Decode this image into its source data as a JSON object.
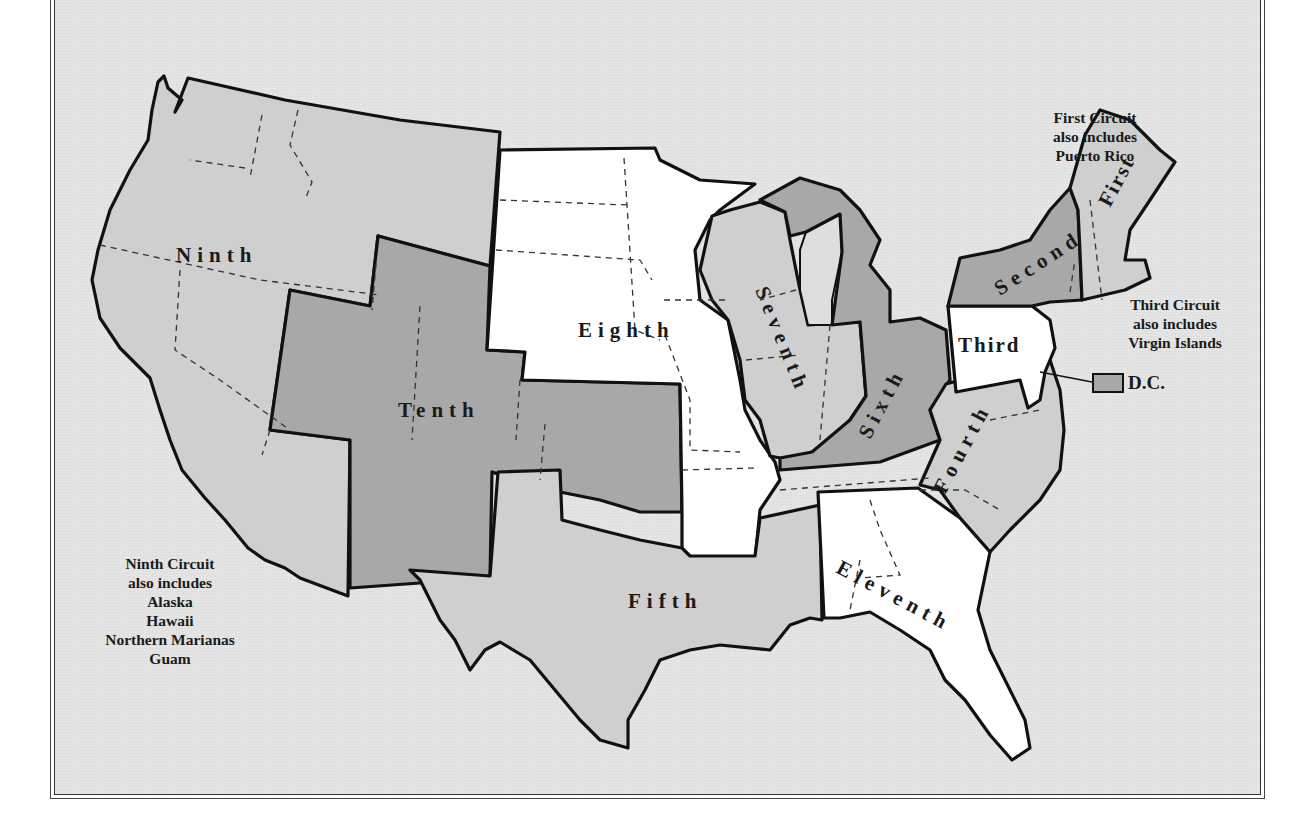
{
  "map": {
    "subject": "U.S. Federal Judicial Circuits",
    "colors": {
      "background": "#e4e4e4",
      "light_gray_fill": "#cfcfcf",
      "dark_gray_fill": "#a8a8a8",
      "white_fill": "#ffffff",
      "border": "#111111"
    },
    "circuits": [
      {
        "id": "first",
        "label": "First",
        "fill": "light"
      },
      {
        "id": "second",
        "label": "Second",
        "fill": "dark"
      },
      {
        "id": "third",
        "label": "Third",
        "fill": "white"
      },
      {
        "id": "fourth",
        "label": "Fourth",
        "fill": "light"
      },
      {
        "id": "fifth",
        "label": "Fifth",
        "fill": "light"
      },
      {
        "id": "sixth",
        "label": "Sixth",
        "fill": "dark"
      },
      {
        "id": "seventh",
        "label": "Seventh",
        "fill": "light"
      },
      {
        "id": "eighth",
        "label": "Eighth",
        "fill": "white"
      },
      {
        "id": "ninth",
        "label": "Ninth",
        "fill": "light"
      },
      {
        "id": "tenth",
        "label": "Tenth",
        "fill": "dark"
      },
      {
        "id": "eleventh",
        "label": "Eleventh",
        "fill": "white"
      }
    ],
    "notes": {
      "first": [
        "First Circuit",
        "also includes",
        "Puerto Rico"
      ],
      "third": [
        "Third Circuit",
        "also includes",
        "Virgin Islands"
      ],
      "ninth": [
        "Ninth Circuit",
        "also includes",
        "Alaska",
        "Hawaii",
        "Northern Marianas",
        "Guam"
      ]
    },
    "dc_key": {
      "label": "D.C.",
      "fill": "dark"
    }
  }
}
